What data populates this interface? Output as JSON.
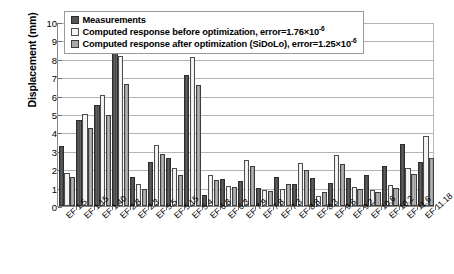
{
  "chart_data": {
    "type": "bar",
    "title": "",
    "xlabel": "",
    "ylabel": "Displacement (mm)",
    "ylim": [
      0,
      10
    ],
    "yticks": [
      0,
      1,
      2,
      3,
      4,
      5,
      6,
      7,
      8,
      9,
      10
    ],
    "grid": true,
    "legend_position": "top-left",
    "categories": [
      "EF 1.5",
      "EF 1.15",
      "EF 1.40",
      "EF 2.8",
      "EF 2.3",
      "EF 5.5",
      "EF 5.15",
      "EF 5.4",
      "EF 6.8",
      "EF 6.3",
      "EF 7.9",
      "EF 7.8",
      "EF 7.3",
      "EF 8.8",
      "EF 8.3",
      "EF 9.6",
      "EF 9.2",
      "EF 10.6",
      "EF 10.2",
      "EF 11.6",
      "EF 11.18"
    ],
    "series": [
      {
        "name": "Measurements",
        "color": "#565656",
        "values": [
          3.25,
          4.65,
          5.5,
          8.9,
          1.55,
          2.4,
          2.6,
          7.1,
          0.6,
          1.45,
          1.35,
          1.0,
          1.55,
          1.2,
          1.5,
          1.25,
          1.5,
          1.7,
          2.2,
          3.35,
          2.4
        ]
      },
      {
        "name": "Computed response before optimization, error=1.76×10",
        "color": "#f1f1f1",
        "values": [
          1.8,
          5.0,
          6.05,
          8.15,
          1.2,
          3.3,
          2.05,
          8.1,
          1.7,
          1.1,
          2.5,
          0.85,
          0.95,
          2.35,
          0.55,
          2.75,
          1.05,
          0.85,
          1.15,
          2.05,
          3.8
        ]
      },
      {
        "name": "Computed response after optimization (SiDoLo), error=1.25×10",
        "color": "#a9a9a9",
        "values": [
          1.55,
          4.25,
          4.95,
          6.65,
          0.95,
          2.85,
          1.7,
          6.55,
          1.4,
          1.05,
          2.2,
          0.8,
          1.2,
          1.95,
          0.75,
          2.3,
          0.9,
          0.75,
          1.0,
          1.75,
          2.6
        ]
      }
    ]
  },
  "legend": {
    "entries": [
      {
        "label": "Measurements",
        "exponent": "",
        "swatch": "dark-swatch"
      },
      {
        "label": "Computed response before optimization, error=1.76×10",
        "exponent": "-6",
        "swatch": "light-swatch"
      },
      {
        "label": "Computed response after optimization (SiDoLo), error=1.25×10",
        "exponent": "-6",
        "swatch": "medium-swatch"
      }
    ]
  }
}
